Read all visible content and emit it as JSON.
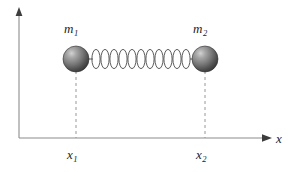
{
  "figure": {
    "background_color": "#ffffff",
    "width": 296,
    "height": 172
  },
  "axes": {
    "line_color": "#8c8c8c",
    "x_axis": {
      "label_base": "x",
      "label_sub": "",
      "start_x": 19,
      "end_x": 272,
      "y": 138,
      "arrow": "arrowhead-right"
    },
    "y_axis": {
      "x": 19,
      "start_y": 138,
      "end_y": 10,
      "arrow": "arrowhead-up"
    },
    "origin": {
      "x": 19,
      "y": 138
    }
  },
  "masses": [
    {
      "name": "mass-1",
      "label_base": "m",
      "label_sub": "1",
      "center_x": 76,
      "center_y": 59,
      "radius": 13,
      "fill_light": "#b4b4b4",
      "fill_dark": "#3a3a3a",
      "position_label_base": "x",
      "position_label_sub": "1"
    },
    {
      "name": "mass-2",
      "label_base": "m",
      "label_sub": "2",
      "center_x": 205,
      "center_y": 59,
      "radius": 13,
      "fill_light": "#b4b4b4",
      "fill_dark": "#3a3a3a",
      "position_label_base": "x",
      "position_label_sub": "2"
    }
  ],
  "spring": {
    "name": "coil-spring",
    "coil_count": 11,
    "start_x": 89,
    "end_x": 192,
    "center_y": 59,
    "amplitude": 10,
    "stroke_color": "#4a4a4a",
    "stroke_width": 0.9
  },
  "drop_lines": [
    {
      "name": "drop-line-x1",
      "x": 76,
      "top_y": 72,
      "bottom_y": 138
    },
    {
      "name": "drop-line-x2",
      "x": 205,
      "top_y": 72,
      "bottom_y": 138
    }
  ],
  "dash_style": {
    "color": "#8c8c8c",
    "dash": "3,3",
    "width": 0.9
  }
}
